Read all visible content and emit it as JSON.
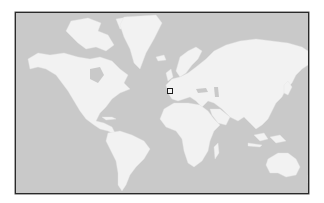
{
  "map": {
    "type": "world-map",
    "projection": "mercator",
    "colors": {
      "ocean": "#c9c9c9",
      "land": "#f2f2f2",
      "frame": "#2a2a2a",
      "marker": "#1c1c1c"
    },
    "marker": {
      "shape": "square",
      "location_label": "Western Europe (southern France / northern Italy)"
    },
    "continents": [
      "North America",
      "Greenland",
      "South America",
      "Europe",
      "Africa",
      "Asia",
      "Australia"
    ]
  }
}
